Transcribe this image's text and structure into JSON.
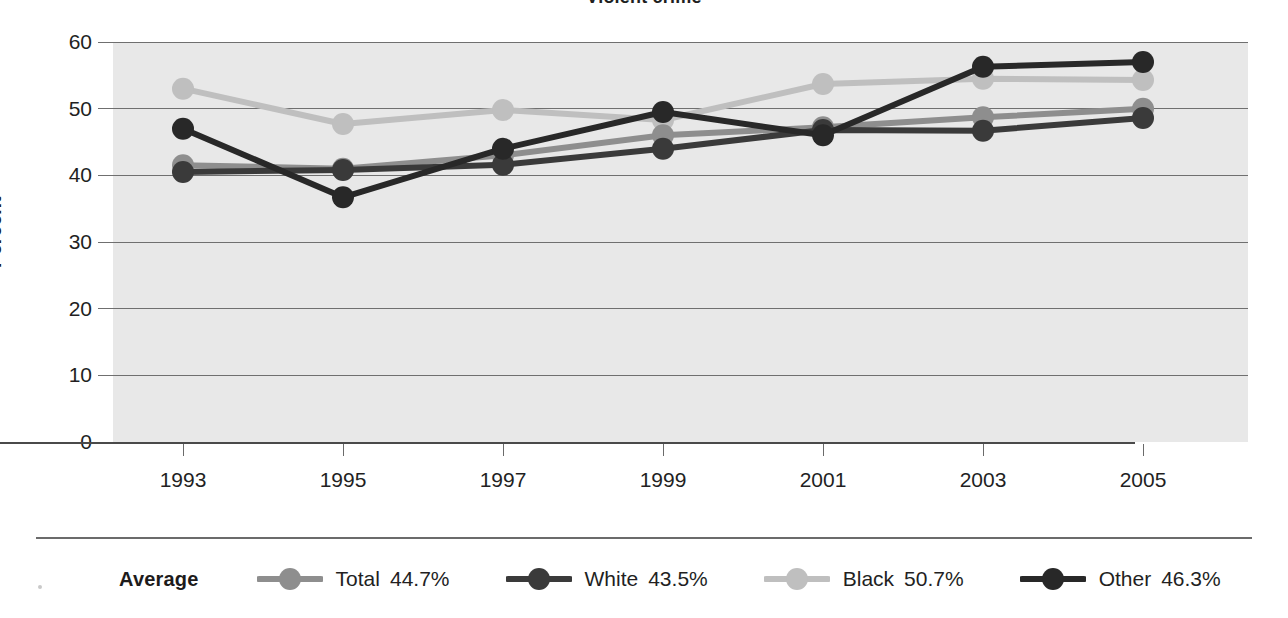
{
  "chart_title": "Violent crime",
  "axes": {
    "y_title": "Percent",
    "y_ticks": [
      "60",
      "50",
      "40",
      "30",
      "20",
      "10",
      "0"
    ],
    "x_ticks": [
      "1993",
      "1995",
      "1997",
      "1999",
      "2001",
      "2003",
      "2005"
    ]
  },
  "legend": {
    "title": "Average",
    "items": [
      {
        "label": "Total",
        "value": "44.7%",
        "color": "#8e8e8e",
        "swatch": "line-marker-swatch"
      },
      {
        "label": "White",
        "value": "43.5%",
        "color": "#3a3a3a",
        "swatch": "line-marker-swatch"
      },
      {
        "label": "Black",
        "value": "50.7%",
        "color": "#bfbfbf",
        "swatch": "line-marker-swatch"
      },
      {
        "label": "Other",
        "value": "46.3%",
        "color": "#282828",
        "swatch": "line-marker-swatch"
      }
    ]
  },
  "colors": {
    "plot_background": "#e8e8e8",
    "gridline": "#6f6f6f",
    "axis": "#4a4a4a",
    "text": "#231f1f",
    "total": "#8e8e8e",
    "white_series": "#3a3a3a",
    "black_series": "#bfbfbf",
    "other": "#282828"
  },
  "chart_data": {
    "type": "line",
    "title": "Violent crime",
    "xlabel": "",
    "ylabel": "Percent",
    "ylim": [
      0,
      60
    ],
    "ytick_step": 10,
    "grid": true,
    "legend_position": "bottom",
    "x": [
      "1993",
      "1995",
      "1997",
      "1999",
      "2001",
      "2003",
      "2005"
    ],
    "categories": [
      "1993",
      "1995",
      "1997",
      "1999",
      "2001",
      "2003",
      "2005"
    ],
    "series": [
      {
        "name": "Total",
        "average": 44.7,
        "color": "#8e8e8e",
        "values": [
          41.5,
          41.0,
          43.0,
          46.0,
          47.2,
          48.7,
          50.0
        ]
      },
      {
        "name": "White",
        "average": 43.5,
        "color": "#3a3a3a",
        "values": [
          40.5,
          40.8,
          41.6,
          44.0,
          46.8,
          46.7,
          48.6
        ]
      },
      {
        "name": "Black",
        "average": 50.7,
        "color": "#bfbfbf",
        "values": [
          53.0,
          47.7,
          49.8,
          48.3,
          53.7,
          54.5,
          54.3
        ]
      },
      {
        "name": "Other",
        "average": 46.3,
        "color": "#282828",
        "values": [
          47.0,
          36.7,
          44.0,
          49.5,
          46.0,
          56.3,
          57.0
        ]
      }
    ]
  }
}
